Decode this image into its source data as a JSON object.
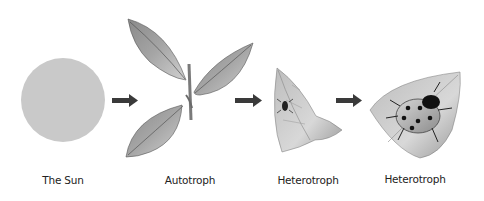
{
  "diagram": {
    "type": "food-chain",
    "nodes": [
      {
        "id": "sun",
        "label": "The Sun",
        "image": "sun-circle"
      },
      {
        "id": "autotroph",
        "label": "Autotroph",
        "image": "plant-leaves"
      },
      {
        "id": "heterotroph-1",
        "label": "Heterotroph",
        "image": "aphid-on-leaf"
      },
      {
        "id": "heterotroph-2",
        "label": "Heterotroph",
        "image": "ladybug-on-leaf"
      }
    ],
    "edges": [
      {
        "from": "sun",
        "to": "autotroph",
        "icon": "arrow-right-icon"
      },
      {
        "from": "autotroph",
        "to": "heterotroph-1",
        "icon": "arrow-right-icon"
      },
      {
        "from": "heterotroph-1",
        "to": "heterotroph-2",
        "icon": "arrow-right-icon"
      }
    ],
    "colors": {
      "sun": "#c9c9c9",
      "leaf_dark": "#6e6e6e",
      "leaf_light": "#c8c8c8",
      "arrow": "#3a3a3a",
      "text": "#222222"
    }
  }
}
